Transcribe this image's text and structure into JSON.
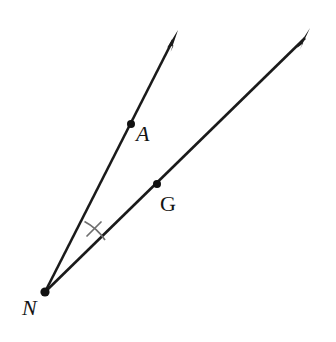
{
  "figure": {
    "background_color": "#ffffff",
    "line_color": "#1a1a1a",
    "mark_color": "#6f6f6f",
    "width": 336,
    "height": 342
  },
  "labels": {
    "vertex": "N",
    "point_on_upper_ray": "A",
    "point_on_lower_ray": "G"
  },
  "points": {
    "N": {
      "name": "N",
      "x": 45,
      "y": 292,
      "kind": "vertex",
      "label_x": 22,
      "label_y": 315
    },
    "A": {
      "name": "A",
      "x": 131,
      "y": 124,
      "kind": "point",
      "label_x": 136,
      "label_y": 141
    },
    "G": {
      "name": "G",
      "x": 157,
      "y": 184,
      "kind": "point",
      "label_x": 160,
      "label_y": 211
    }
  },
  "rays": [
    {
      "name": "ray-NA",
      "from": "N",
      "through": "A",
      "start_x": 45,
      "start_y": 292,
      "tip_x": 178,
      "tip_y": 30,
      "has_arrowhead": true
    },
    {
      "name": "ray-NG",
      "from": "N",
      "through": "G",
      "start_x": 45,
      "start_y": 292,
      "tip_x": 310,
      "tip_y": 28,
      "has_arrowhead": true
    }
  ],
  "angle_mark": {
    "name": "angle-ANG",
    "vertex": "N",
    "style": "single-tick-arc",
    "arc_path": "M 84.5 221.5 A 57 57 0 0 1 105 240",
    "tick_x1": 87,
    "tick_y1": 236,
    "tick_x2": 101,
    "tick_y2": 222
  }
}
